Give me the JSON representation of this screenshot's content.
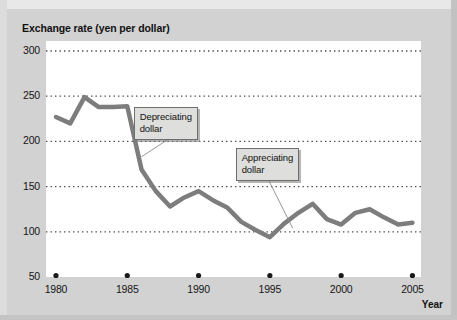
{
  "chart_data": {
    "type": "line",
    "title": "Exchange rate (yen per dollar)",
    "xlabel": "Year",
    "ylabel": "",
    "ylim": [
      50,
      300
    ],
    "xlim": [
      1979.3,
      2005.6
    ],
    "grid": true,
    "yticks": [
      300,
      250,
      200,
      150,
      100,
      50
    ],
    "ytick_labels": [
      "300",
      "250",
      "200",
      "150",
      "100",
      "50"
    ],
    "xticks": [
      1980,
      1985,
      1990,
      1995,
      2000,
      2005
    ],
    "xtick_labels": [
      "1980",
      "1985",
      "1990",
      "1995",
      "2000",
      "2005"
    ],
    "legend": null,
    "line_color": "#7d7d7d",
    "line_width": 4.5,
    "series": [
      {
        "name": "Exchange rate (yen per dollar)",
        "x": [
          1980,
          1981,
          1982,
          1983,
          1984,
          1985,
          1986,
          1987,
          1988,
          1989,
          1990,
          1991,
          1992,
          1993,
          1994,
          1995,
          1996,
          1997,
          1998,
          1999,
          2000,
          2001,
          2002,
          2003,
          2004,
          2005
        ],
        "values": [
          227,
          220,
          249,
          238,
          238,
          239,
          169,
          145,
          128,
          138,
          145,
          135,
          127,
          111,
          102,
          94,
          109,
          121,
          131,
          114,
          108,
          121,
          125,
          116,
          108,
          110
        ]
      }
    ],
    "annotations": [
      {
        "id": "depreciating",
        "text_lines": [
          "Depreciating",
          "dollar"
        ],
        "label": "Depreciating dollar",
        "box_x": 1985.45,
        "box_y": 238,
        "point_x": 1986.0,
        "point_y": 183
      },
      {
        "id": "appreciating",
        "text_lines": [
          "Appreciating",
          "dollar"
        ],
        "label": "Appreciating dollar",
        "box_x": 1992.6,
        "box_y": 193,
        "point_x": 1996.6,
        "point_y": 104
      }
    ]
  },
  "axis": {
    "y_labels": [
      "300",
      "250",
      "200",
      "150",
      "100",
      "50"
    ],
    "x_labels": [
      "1980",
      "1985",
      "1990",
      "1995",
      "2000",
      "2005"
    ],
    "x_title": "Year"
  },
  "annotations": {
    "depreciating": {
      "line1": "Depreciating",
      "line2": "dollar"
    },
    "appreciating": {
      "line1": "Appreciating",
      "line2": "dollar"
    }
  },
  "colors": {
    "line": "#7d7d7d",
    "plot_background": "#ffffff",
    "figure_background": "#d2d2d2",
    "gridline": "#4a4a4a",
    "callout_fill": "#dededc",
    "callout_border": "#6e6e6e"
  }
}
